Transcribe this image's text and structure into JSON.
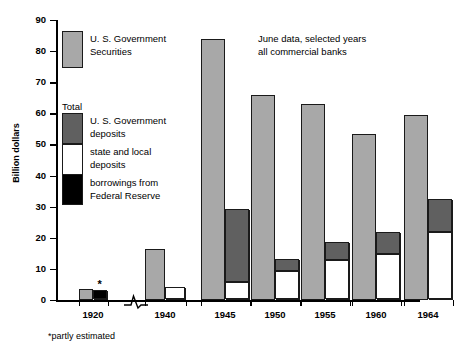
{
  "chart_data": {
    "type": "bar",
    "title": "",
    "annotation_lines": [
      "June data, selected years",
      "all commercial banks"
    ],
    "footnote": "*partly estimated",
    "xlabel": "",
    "ylabel": "Billion dollars",
    "ylim": [
      0,
      90
    ],
    "ytick_step": 10,
    "yticks": [
      0,
      10,
      20,
      30,
      40,
      50,
      60,
      70,
      80,
      90
    ],
    "grid": false,
    "legend_position": "inside-upper-left",
    "axis_break_between": [
      "1920",
      "1940"
    ],
    "categories": [
      "1920",
      "1940",
      "1945",
      "1950",
      "1955",
      "1960",
      "1964"
    ],
    "series": [
      {
        "name": "U. S. Government Securities",
        "color": "#a8a8a8",
        "values": [
          3.4,
          16.3,
          84.0,
          66.0,
          63.0,
          53.5,
          59.5
        ]
      },
      {
        "name": "Total",
        "note": "second bar of each pair; stacked from bottom: borrowings from Federal Reserve (black), state and local deposits (white), U. S. Government deposits (dark gray)",
        "stack": [
          {
            "name": "borrowings from Federal Reserve",
            "color": "#000000",
            "values": [
              2.9,
              0,
              0,
              0,
              0,
              0,
              0
            ]
          },
          {
            "name": "state and local deposits",
            "color": "#ffffff",
            "values": [
              0,
              4.0,
              5.5,
              9.0,
              12.7,
              14.5,
              21.5
            ]
          },
          {
            "name": "U. S. Government deposits",
            "color": "#606060",
            "values": [
              0,
              0,
              23.5,
              3.8,
              5.7,
              7.0,
              10.5
            ]
          }
        ],
        "totals": [
          2.9,
          4.0,
          29.0,
          12.8,
          18.4,
          21.5,
          32.0
        ]
      }
    ],
    "partly_estimated_marker": {
      "category": "1920",
      "symbol": "*"
    }
  },
  "axis": {
    "ylabel": "Billion dollars",
    "ytick_labels": [
      "0",
      "10",
      "20",
      "30",
      "40",
      "50",
      "60",
      "70",
      "80",
      "90"
    ],
    "xtick_labels": [
      "1920",
      "1940",
      "1945",
      "1950",
      "1955",
      "1960",
      "1964"
    ]
  },
  "legend": {
    "securities_label_line1": "U. S. Government",
    "securities_label_line2": "Securities",
    "total_label": "Total",
    "govt_deposits_line1": "U. S. Government",
    "govt_deposits_line2": "deposits",
    "state_local_line1": "state and local",
    "state_local_line2": "deposits",
    "borrowings_line1": "borrowings from",
    "borrowings_line2": "Federal Reserve"
  },
  "caption": {
    "line1": "June data, selected years",
    "line2": "all commercial banks"
  },
  "footnote": {
    "text": "*partly estimated"
  },
  "colors": {
    "securities": "#a8a8a8",
    "govt_deposits": "#606060",
    "state_local_deposits": "#ffffff",
    "borrowings": "#000000",
    "outline": "#1a1a1a",
    "background": "#ffffff"
  }
}
